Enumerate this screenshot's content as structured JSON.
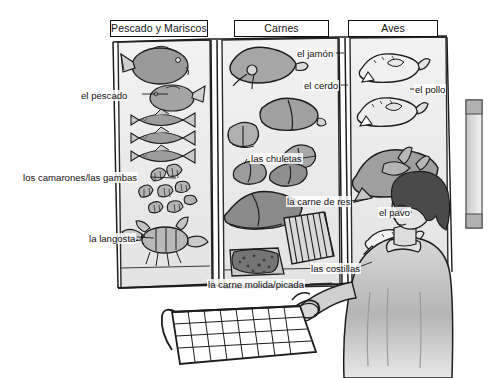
{
  "scene": {
    "title": "Supermarket meat and seafood display case illustration",
    "width": 489,
    "height": 378,
    "background_color": "#ffffff",
    "ink_color": "#111111",
    "fill_gray_light": "#dcdcdc",
    "fill_gray_mid": "#a9a9a9",
    "fill_gray_dark": "#6e6e6e",
    "fill_hair_dark": "#4a4a4a"
  },
  "categories": [
    {
      "id": "fish",
      "label": "Pescado y Mariscos"
    },
    {
      "id": "meat",
      "label": "Carnes"
    },
    {
      "id": "fowl",
      "label": "Aves"
    }
  ],
  "labels": {
    "pescado": "el pescado",
    "camarones": "los camarones/las gambas",
    "langosta": "la langosta",
    "jamon": "el jamón",
    "cerdo": "el cerdo",
    "chuletas": "las chuletas",
    "carne_de_res": "la carne de res",
    "costillas": "las costillas",
    "carne_molida": "la carne molida/picada",
    "pollo": "el pollo",
    "pavo": "el pavo"
  },
  "figure": {
    "name": "shopper"
  }
}
